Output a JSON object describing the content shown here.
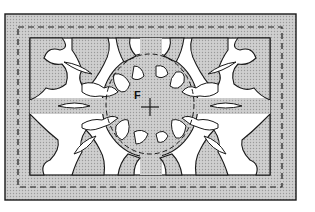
{
  "diagram": {
    "center_label": "F",
    "center_marker": "plus-crosshair",
    "colors": {
      "panel_fill": "#c8c8c8",
      "cutout_fill": "#ffffff",
      "outline": "#1a1a1a"
    },
    "outer_border": {
      "x": 5,
      "y": 14,
      "width": 291,
      "height": 186
    },
    "dashed_border": {
      "x": 18,
      "y": 27,
      "width": 264,
      "height": 160
    },
    "inner_frame": {
      "x": 30,
      "y": 38,
      "width": 240,
      "height": 137
    },
    "center_ellipse": {
      "cx": 150,
      "cy": 105,
      "rx": 42,
      "ry": 52
    }
  }
}
